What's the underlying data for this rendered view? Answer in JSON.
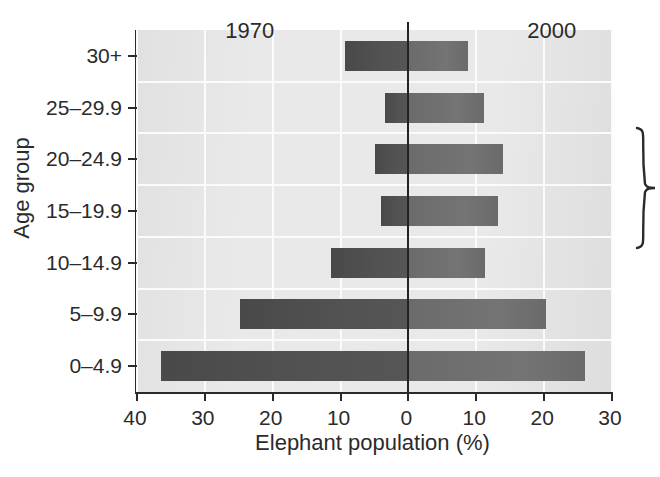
{
  "chart_data": {
    "type": "bar",
    "subtype": "population-pyramid",
    "title": "",
    "xlabel": "Elephant population (%)",
    "ylabel": "Age group",
    "categories": [
      "0–4.9",
      "5–9.9",
      "10–14.9",
      "15–19.9",
      "20–24.9",
      "25–29.9",
      "30+"
    ],
    "series": [
      {
        "name": "1970",
        "side": "left",
        "color": "#4d4d4d",
        "values": [
          36.5,
          24.8,
          11.4,
          4.0,
          5.0,
          3.4,
          9.3
        ]
      },
      {
        "name": "2000",
        "side": "right",
        "color": "#6f6f6f",
        "values": [
          26.0,
          20.3,
          11.3,
          13.2,
          13.9,
          11.2,
          8.8
        ]
      }
    ],
    "x_ticks_left": [
      40,
      30,
      20,
      10
    ],
    "x_ticks_right": [
      0,
      10,
      20,
      30
    ],
    "x_tick_labels": [
      "40",
      "30",
      "20",
      "10",
      "0",
      "10",
      "20",
      "30"
    ],
    "xlim_left": 40,
    "xlim_right": 30,
    "grid": true,
    "grid_color": "#fbfbfb",
    "plot_background": "#e9e9e9",
    "zero_line_color": "#222222",
    "legend_position": "in-plot-top",
    "annotations": [
      {
        "name": "prime-reproductive-years",
        "text_lines": [
          "Prime",
          "reproductive",
          "years"
        ],
        "brace_spans_categories": [
          "15–19.9",
          "20–24.9",
          "25–29.9"
        ]
      }
    ]
  },
  "axes": {
    "x_title": "Elephant population (%)",
    "y_title": "Age group",
    "x_tick_labels": [
      "40",
      "30",
      "20",
      "10",
      "0",
      "10",
      "20",
      "30"
    ],
    "y_tick_labels": [
      "30+",
      "25–29.9",
      "20–24.9",
      "15–19.9",
      "10–14.9",
      "5–9.9",
      "0–4.9"
    ]
  },
  "series_labels": {
    "left": "1970",
    "right": "2000"
  },
  "annotation": {
    "line1": "Prime",
    "line2": "reproductive",
    "line3": "years"
  }
}
